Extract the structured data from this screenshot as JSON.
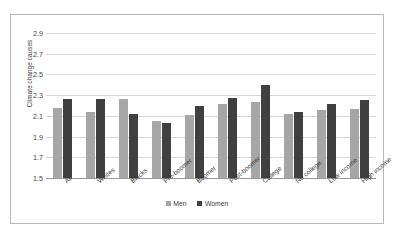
{
  "chart_data": {
    "type": "bar",
    "title": "",
    "xlabel": "",
    "ylabel": "Climate change causes",
    "ylim": [
      1.5,
      2.9
    ],
    "yticks": [
      "1.5",
      "1.7",
      "1.9",
      "2.1",
      "2.3",
      "2.5",
      "2.7",
      "2.9"
    ],
    "ytick_values": [
      1.5,
      1.7,
      1.9,
      2.1,
      2.3,
      2.5,
      2.7,
      2.9
    ],
    "grid": true,
    "legend_position": "bottom",
    "categories": [
      "All",
      "Whites",
      "Blacks",
      "Pre-boomer",
      "Boomer",
      "Post-boomer",
      "College",
      "No college",
      "Low income",
      "High income"
    ],
    "series": [
      {
        "name": "Men",
        "color": "#a6a6a6",
        "values": [
          2.18,
          2.14,
          2.26,
          2.05,
          2.11,
          2.21,
          2.23,
          2.12,
          2.16,
          2.17
        ]
      },
      {
        "name": "Women",
        "color": "#404040",
        "values": [
          2.26,
          2.26,
          2.12,
          2.03,
          2.2,
          2.27,
          2.4,
          2.14,
          2.21,
          2.25
        ]
      }
    ]
  }
}
